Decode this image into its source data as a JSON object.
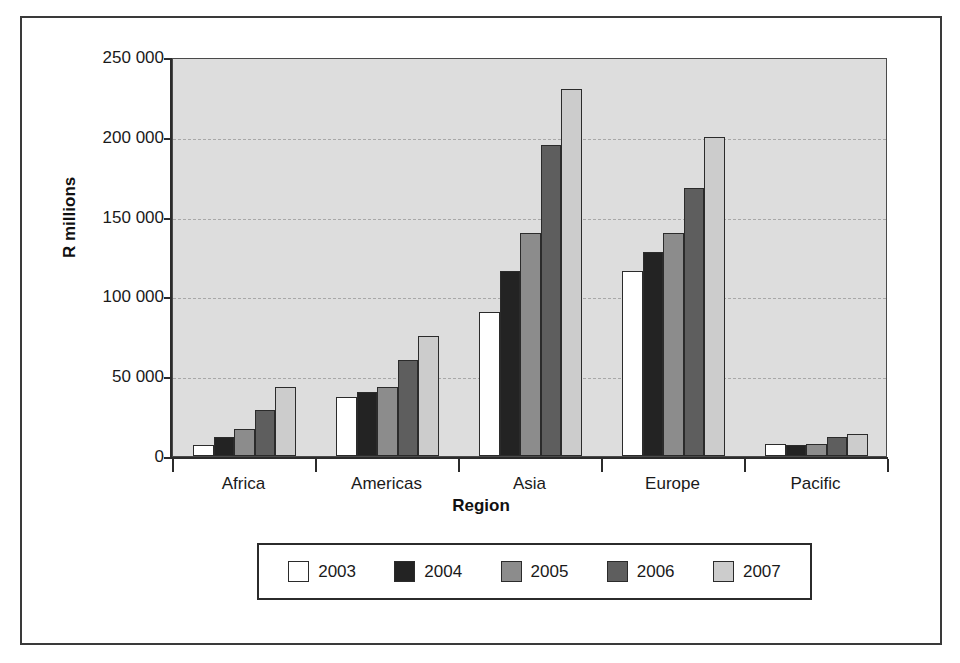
{
  "chart_data": {
    "type": "bar",
    "title": "",
    "xlabel": "Region",
    "ylabel": "R millions",
    "categories": [
      "Africa",
      "Americas",
      "Asia",
      "Europe",
      "Pacific"
    ],
    "series": [
      {
        "name": "2003",
        "color": "#ffffff",
        "values": [
          7000,
          37000,
          90000,
          116000,
          7500
        ]
      },
      {
        "name": "2004",
        "color": "#232323",
        "values": [
          12000,
          40000,
          116000,
          128000,
          7000
        ]
      },
      {
        "name": "2005",
        "color": "#8c8c8c",
        "values": [
          17000,
          43000,
          140000,
          140000,
          7500
        ]
      },
      {
        "name": "2006",
        "color": "#5e5e5e",
        "values": [
          29000,
          60000,
          195000,
          168000,
          12000
        ]
      },
      {
        "name": "2007",
        "color": "#cccccc",
        "values": [
          43000,
          75000,
          230000,
          200000,
          13500
        ]
      }
    ],
    "ylim": [
      0,
      250000
    ],
    "ytick_values": [
      0,
      50000,
      100000,
      150000,
      200000,
      250000
    ],
    "ytick_labels": [
      "0",
      "50 000",
      "100 000",
      "150 000",
      "200 000",
      "250 000"
    ],
    "grid": true,
    "gridline_style": "dashed",
    "gridline_color": "#a8a8a8",
    "plot_background": "#dddddd",
    "legend": {
      "position": "bottom",
      "entries": [
        {
          "label": "2003",
          "color": "#ffffff"
        },
        {
          "label": "2004",
          "color": "#232323"
        },
        {
          "label": "2005",
          "color": "#8c8c8c"
        },
        {
          "label": "2006",
          "color": "#5e5e5e"
        },
        {
          "label": "2007",
          "color": "#cccccc"
        }
      ]
    }
  }
}
